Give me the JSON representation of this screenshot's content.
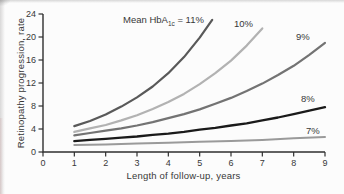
{
  "figure": {
    "background": "#fcfcfc",
    "text_color": "#383838",
    "axis_color": "#2f2f2f"
  },
  "chart_data": {
    "type": "line",
    "title": "",
    "xlabel": "Length of follow-up, years",
    "ylabel": "Retinopathy progression, rate",
    "xlim": [
      0,
      9
    ],
    "ylim": [
      0,
      24
    ],
    "x_ticks": [
      0,
      1,
      2,
      3,
      4,
      5,
      6,
      7,
      8,
      9
    ],
    "y_ticks": [
      0,
      4,
      8,
      12,
      16,
      20,
      24
    ],
    "grid": false,
    "legend_position": "inline-curve-labels",
    "annotation": {
      "pre": "Mean HbA",
      "sub": "1c",
      "post": " = 11%"
    },
    "series": [
      {
        "name": "Mean HbA1c 11%",
        "label": "11%",
        "color": "#595959",
        "width": 2.2,
        "points": [
          [
            1,
            4.5
          ],
          [
            1.5,
            5.4
          ],
          [
            2,
            6.5
          ],
          [
            2.5,
            7.9
          ],
          [
            3,
            9.5
          ],
          [
            3.5,
            11.4
          ],
          [
            4,
            13.7
          ],
          [
            4.5,
            16.5
          ],
          [
            5,
            19.9
          ],
          [
            5.4,
            23.0
          ]
        ]
      },
      {
        "name": "Mean HbA1c 10%",
        "label": "10%",
        "color": "#b2b2b2",
        "width": 2.2,
        "points": [
          [
            1,
            3.5
          ],
          [
            1.5,
            4.1
          ],
          [
            2,
            4.7
          ],
          [
            2.5,
            5.5
          ],
          [
            3,
            6.4
          ],
          [
            3.5,
            7.5
          ],
          [
            4,
            8.7
          ],
          [
            4.5,
            10.1
          ],
          [
            5,
            11.8
          ],
          [
            5.5,
            13.7
          ],
          [
            6,
            15.9
          ],
          [
            6.5,
            18.5
          ],
          [
            7,
            21.5
          ]
        ]
      },
      {
        "name": "Mean HbA1c 9%",
        "label": "9%",
        "color": "#737373",
        "width": 2.2,
        "points": [
          [
            1,
            2.9
          ],
          [
            1.5,
            3.3
          ],
          [
            2,
            3.7
          ],
          [
            2.5,
            4.1
          ],
          [
            3,
            4.6
          ],
          [
            3.5,
            5.2
          ],
          [
            4,
            5.9
          ],
          [
            4.5,
            6.6
          ],
          [
            5,
            7.4
          ],
          [
            5.5,
            8.4
          ],
          [
            6,
            9.4
          ],
          [
            6.5,
            10.6
          ],
          [
            7,
            11.9
          ],
          [
            7.5,
            13.4
          ],
          [
            8,
            15.0
          ],
          [
            8.5,
            16.9
          ],
          [
            9,
            19.0
          ]
        ]
      },
      {
        "name": "Mean HbA1c 8%",
        "label": "8%",
        "color": "#1a1a1a",
        "width": 2.3,
        "points": [
          [
            1,
            1.9
          ],
          [
            1.5,
            2.1
          ],
          [
            2,
            2.3
          ],
          [
            2.5,
            2.5
          ],
          [
            3,
            2.7
          ],
          [
            3.5,
            3.0
          ],
          [
            4,
            3.2
          ],
          [
            4.5,
            3.5
          ],
          [
            5,
            3.9
          ],
          [
            5.5,
            4.2
          ],
          [
            6,
            4.6
          ],
          [
            6.5,
            5.0
          ],
          [
            7,
            5.5
          ],
          [
            7.5,
            6.0
          ],
          [
            8,
            6.6
          ],
          [
            8.5,
            7.2
          ],
          [
            9,
            7.8
          ]
        ]
      },
      {
        "name": "Mean HbA1c 7%",
        "label": "7%",
        "color": "#9a9a9a",
        "width": 2.0,
        "points": [
          [
            1,
            1.2
          ],
          [
            2,
            1.3
          ],
          [
            3,
            1.5
          ],
          [
            4,
            1.6
          ],
          [
            5,
            1.8
          ],
          [
            6,
            1.9
          ],
          [
            7,
            2.1
          ],
          [
            8,
            2.4
          ],
          [
            9,
            2.6
          ]
        ]
      }
    ]
  }
}
